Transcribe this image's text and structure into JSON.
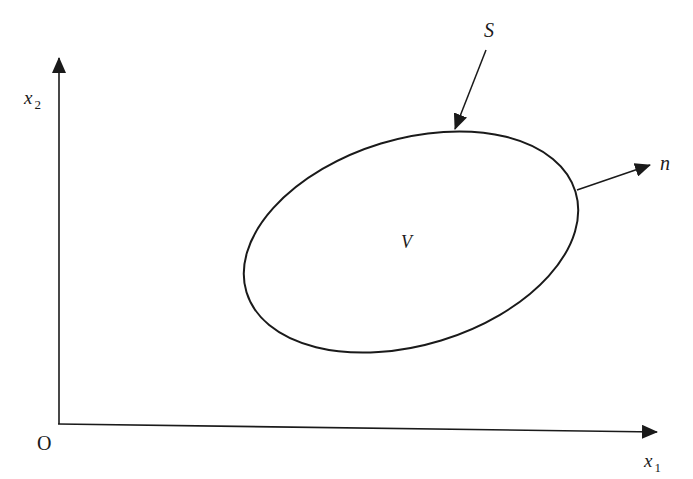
{
  "diagram": {
    "labels": {
      "x2_axis": {
        "main": "x",
        "sub": "2"
      },
      "x1_axis": {
        "main": "x",
        "sub": "1"
      },
      "origin": "O",
      "surface": "S",
      "normal": "n",
      "volume": "V"
    },
    "colors": {
      "stroke": "#1a1a1a",
      "background": "#ffffff"
    }
  }
}
